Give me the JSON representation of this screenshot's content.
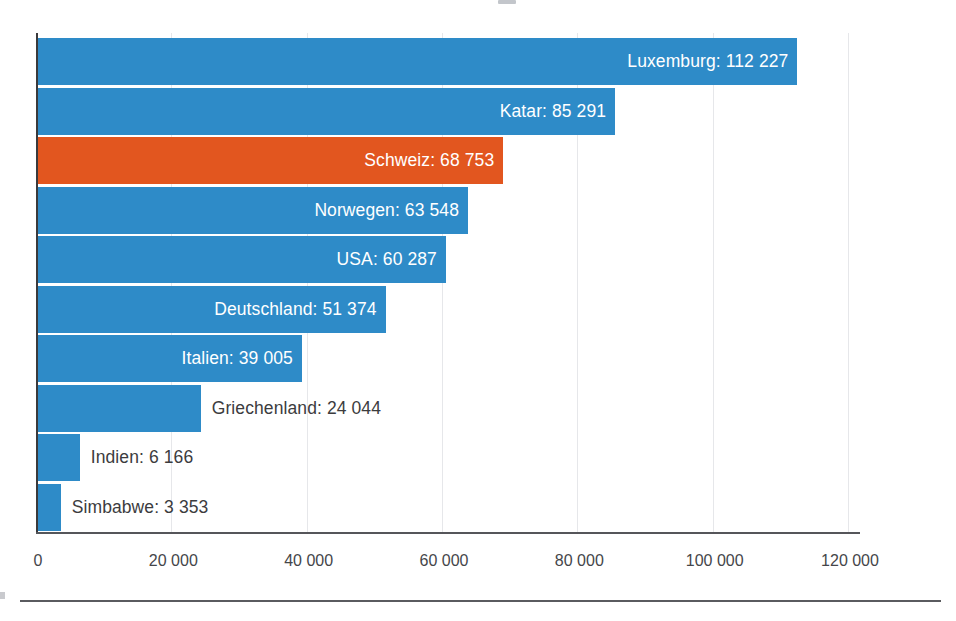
{
  "chart_data": {
    "type": "bar",
    "orientation": "horizontal",
    "title": "",
    "subtitle": "",
    "xlabel": "",
    "ylabel": "",
    "xlim": [
      0,
      120000
    ],
    "grid": true,
    "legend": "none",
    "highlight_label": "Schweiz",
    "colors": {
      "bar": "#2e8bc8",
      "highlight": "#e2561f",
      "label_inside": "#ffffff",
      "label_outside": "#3c3c3e",
      "gridline": "#e6e7ea",
      "axis": "#3a3a3c"
    },
    "xticks": [
      {
        "value": 0,
        "label": "0"
      },
      {
        "value": 20000,
        "label": "20 000"
      },
      {
        "value": 40000,
        "label": "40 000"
      },
      {
        "value": 60000,
        "label": "60 000"
      },
      {
        "value": 80000,
        "label": "80 000"
      },
      {
        "value": 100000,
        "label": "100 000"
      },
      {
        "value": 120000,
        "label": "120 000"
      }
    ],
    "categories": [
      "Luxemburg",
      "Katar",
      "Schweiz",
      "Norwegen",
      "USA",
      "Deutschland",
      "Italien",
      "Griechenland",
      "Indien",
      "Simbabwe"
    ],
    "values": [
      112227,
      85291,
      68753,
      63548,
      60287,
      51374,
      39005,
      24044,
      6166,
      3353
    ],
    "bars": [
      {
        "category": "Luxemburg",
        "value": 112227,
        "value_label": "112 227",
        "data_label": "Luxemburg: 112 227",
        "highlight": false,
        "label_position": "inside"
      },
      {
        "category": "Katar",
        "value": 85291,
        "value_label": "85 291",
        "data_label": "Katar: 85 291",
        "highlight": false,
        "label_position": "inside"
      },
      {
        "category": "Schweiz",
        "value": 68753,
        "value_label": "68 753",
        "data_label": "Schweiz: 68 753",
        "highlight": true,
        "label_position": "inside"
      },
      {
        "category": "Norwegen",
        "value": 63548,
        "value_label": "63 548",
        "data_label": "Norwegen: 63 548",
        "highlight": false,
        "label_position": "inside"
      },
      {
        "category": "USA",
        "value": 60287,
        "value_label": "60 287",
        "data_label": "USA: 60 287",
        "highlight": false,
        "label_position": "inside"
      },
      {
        "category": "Deutschland",
        "value": 51374,
        "value_label": "51 374",
        "data_label": "Deutschland: 51 374",
        "highlight": false,
        "label_position": "inside"
      },
      {
        "category": "Italien",
        "value": 39005,
        "value_label": "39 005",
        "data_label": "Italien: 39 005",
        "highlight": false,
        "label_position": "inside"
      },
      {
        "category": "Griechenland",
        "value": 24044,
        "value_label": "24 044",
        "data_label": "Griechenland: 24 044",
        "highlight": false,
        "label_position": "outside"
      },
      {
        "category": "Indien",
        "value": 6166,
        "value_label": "6 166",
        "data_label": "Indien: 6 166",
        "highlight": false,
        "label_position": "outside"
      },
      {
        "category": "Simbabwe",
        "value": 3353,
        "value_label": "3 353",
        "data_label": "Simbabwe: 3 353",
        "highlight": false,
        "label_position": "outside"
      }
    ]
  }
}
